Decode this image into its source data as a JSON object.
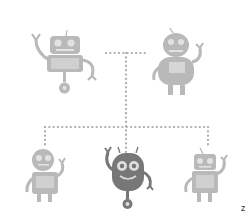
{
  "diagram": {
    "type": "hierarchy",
    "connector_style": "dotted",
    "colors": {
      "background": "#ffffff",
      "robot_light": "#b9b9b9",
      "robot_light_detail": "#e2e2e2",
      "robot_dark": "#777777",
      "robot_dark_detail": "#dcdcdc",
      "connector": "#aaaaaa"
    },
    "top_row": [
      {
        "id": "robot-top-left",
        "style": "boxy-wheel",
        "tone": "light"
      },
      {
        "id": "robot-top-right",
        "style": "round-legs",
        "tone": "light"
      }
    ],
    "bottom_row": [
      {
        "id": "robot-bottom-left",
        "style": "round-head-legs",
        "tone": "light"
      },
      {
        "id": "robot-bottom-center",
        "style": "round-wheel",
        "tone": "dark",
        "highlighted": true
      },
      {
        "id": "robot-bottom-right",
        "style": "boxy-legs",
        "tone": "light"
      }
    ]
  },
  "corner_mark": {
    "text": "z"
  }
}
